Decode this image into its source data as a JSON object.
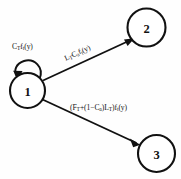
{
  "diagram": {
    "type": "state-transition-diagram",
    "background_color": "#fefefe",
    "stroke_color": "#111111",
    "nodes": [
      {
        "id": "1",
        "label": "1",
        "cx": 27.5,
        "cy": 90.5,
        "r": 17.5
      },
      {
        "id": "2",
        "label": "2",
        "cx": 146.5,
        "cy": 27.5,
        "r": 19.0
      },
      {
        "id": "3",
        "label": "3",
        "cx": 156.5,
        "cy": 153.5,
        "r": 18.5
      }
    ],
    "edges": [
      {
        "id": "self-loop-1",
        "from": "1",
        "to": "1",
        "label_plain": "C_T f_t(y)",
        "label_parts": [
          {
            "text": "C",
            "sub": "T"
          },
          {
            "text": "f",
            "sub": "t"
          },
          {
            "text": "(y)",
            "sub": ""
          }
        ]
      },
      {
        "id": "edge-1-to-2",
        "from": "1",
        "to": "2",
        "label_plain": "L_T C_a f_t(y)",
        "label_parts": [
          {
            "text": "L",
            "sub": "T"
          },
          {
            "text": "C",
            "sub": "a"
          },
          {
            "text": "f",
            "sub": "t"
          },
          {
            "text": "(y)",
            "sub": ""
          }
        ]
      },
      {
        "id": "edge-1-to-3",
        "from": "1",
        "to": "3",
        "label_plain": "(F_T+(1-C_a)L_T)f_t(y)",
        "label_parts": [
          {
            "text": "(F",
            "sub": "T"
          },
          {
            "text": "+(1-C",
            "sub": "a"
          },
          {
            "text": ")L",
            "sub": "T"
          },
          {
            "text": ")f",
            "sub": "t"
          },
          {
            "text": "(y)",
            "sub": ""
          }
        ]
      }
    ]
  }
}
